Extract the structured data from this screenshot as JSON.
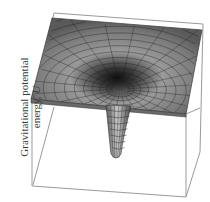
{
  "figure": {
    "axis_label_line1": "Gravitational potential",
    "axis_label_line2_prefix": "energy, ",
    "axis_label_symbol": "U",
    "colors": {
      "surface_light": "#b8b8b8",
      "surface_dark": "#2a2a2a",
      "mesh": "#1a1a1a",
      "box": "#9a9a9a",
      "label": "#3a3a3a"
    },
    "mesh": {
      "rings": 14,
      "spokes": 24
    }
  }
}
